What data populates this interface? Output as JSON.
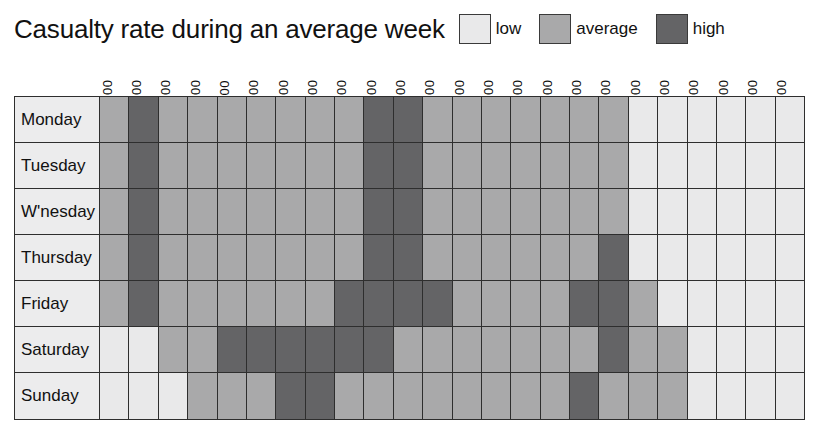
{
  "header": {
    "title": "Casualty rate during an average week"
  },
  "legend": {
    "items": [
      {
        "label": "low",
        "key": "low",
        "color": "#e9e9ea"
      },
      {
        "label": "average",
        "key": "average",
        "color": "#a9a9aa"
      },
      {
        "label": "high",
        "key": "high",
        "color": "#646466"
      }
    ]
  },
  "chart_data": {
    "type": "heatmap",
    "title": "Casualty rate during an average week",
    "xlabel": "",
    "ylabel": "",
    "grid": true,
    "legend_position": "top-right",
    "categories_x": [
      "0700",
      "0800",
      "0900",
      "1000",
      "1100",
      "1200",
      "1300",
      "1400",
      "1500",
      "1600",
      "1700",
      "1800",
      "1900",
      "2000",
      "2100",
      "2200",
      "2300",
      "2400",
      "0100",
      "0200",
      "0300",
      "0400",
      "0500",
      "0600"
    ],
    "categories_y": [
      "Monday",
      "Tuesday",
      "W'nesday",
      "Thursday",
      "Friday",
      "Saturday",
      "Sunday"
    ],
    "value_levels": [
      "low",
      "average",
      "high"
    ],
    "value_scale": {
      "low": 1,
      "average": 2,
      "high": 3
    },
    "rows": [
      {
        "day": "Monday",
        "values": [
          "average",
          "high",
          "average",
          "average",
          "average",
          "average",
          "average",
          "average",
          "average",
          "high",
          "high",
          "average",
          "average",
          "average",
          "average",
          "average",
          "average",
          "average",
          "low",
          "low",
          "low",
          "low",
          "low",
          "low"
        ]
      },
      {
        "day": "Tuesday",
        "values": [
          "average",
          "high",
          "average",
          "average",
          "average",
          "average",
          "average",
          "average",
          "average",
          "high",
          "high",
          "average",
          "average",
          "average",
          "average",
          "average",
          "average",
          "average",
          "low",
          "low",
          "low",
          "low",
          "low",
          "low"
        ]
      },
      {
        "day": "W'nesday",
        "values": [
          "average",
          "high",
          "average",
          "average",
          "average",
          "average",
          "average",
          "average",
          "average",
          "high",
          "high",
          "average",
          "average",
          "average",
          "average",
          "average",
          "average",
          "average",
          "low",
          "low",
          "low",
          "low",
          "low",
          "low"
        ]
      },
      {
        "day": "Thursday",
        "values": [
          "average",
          "high",
          "average",
          "average",
          "average",
          "average",
          "average",
          "average",
          "average",
          "high",
          "high",
          "average",
          "average",
          "average",
          "average",
          "average",
          "average",
          "high",
          "low",
          "low",
          "low",
          "low",
          "low",
          "low"
        ]
      },
      {
        "day": "Friday",
        "values": [
          "average",
          "high",
          "average",
          "average",
          "average",
          "average",
          "average",
          "average",
          "high",
          "high",
          "high",
          "high",
          "average",
          "average",
          "average",
          "average",
          "high",
          "high",
          "average",
          "low",
          "low",
          "low",
          "low",
          "low"
        ]
      },
      {
        "day": "Saturday",
        "values": [
          "low",
          "low",
          "average",
          "average",
          "high",
          "high",
          "high",
          "high",
          "high",
          "high",
          "average",
          "average",
          "average",
          "average",
          "average",
          "average",
          "average",
          "high",
          "average",
          "average",
          "low",
          "low",
          "low",
          "low"
        ]
      },
      {
        "day": "Sunday",
        "values": [
          "low",
          "low",
          "low",
          "average",
          "average",
          "average",
          "high",
          "high",
          "average",
          "average",
          "average",
          "average",
          "average",
          "average",
          "average",
          "average",
          "high",
          "average",
          "average",
          "average",
          "low",
          "low",
          "low",
          "low"
        ]
      }
    ]
  }
}
